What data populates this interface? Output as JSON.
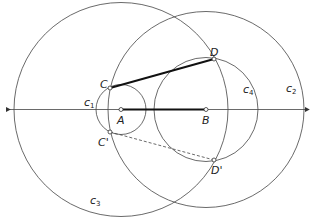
{
  "diagram": {
    "points": {
      "A": {
        "label": "A",
        "x": 121,
        "y": 109.5
      },
      "B": {
        "label": "B",
        "x": 206,
        "y": 109.5
      },
      "C": {
        "label": "C",
        "x": 110,
        "y": 88
      },
      "D": {
        "label": "D",
        "x": 214,
        "y": 59
      },
      "C_prime": {
        "label": "C'",
        "x": 110,
        "y": 132
      },
      "D_prime": {
        "label": "D'",
        "x": 214,
        "y": 160
      }
    },
    "circles": {
      "c1": {
        "label": "c",
        "sub": "1",
        "cx": 121,
        "cy": 109.5,
        "r": 25
      },
      "c2": {
        "label": "c",
        "sub": "2",
        "cx": 206,
        "cy": 109.5,
        "r": 98
      },
      "c3": {
        "label": "c",
        "sub": "3",
        "cx": 121,
        "cy": 109.5,
        "r": 107
      },
      "c4": {
        "label": "c",
        "sub": "4",
        "cx": 206,
        "cy": 109.5,
        "r": 52
      }
    },
    "colors": {
      "stroke": "#444444",
      "thick": "#111111"
    }
  }
}
